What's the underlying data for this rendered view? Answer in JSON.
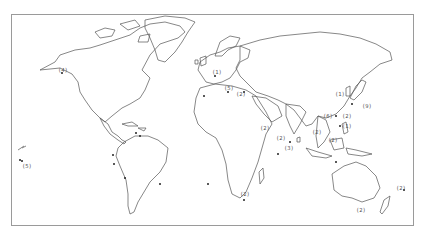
{
  "map": {
    "type": "world outline map",
    "style": "monochrome line drawing",
    "colors": {
      "land_outline": "#555555",
      "frame": "#9a9a9a",
      "marker": "#222222",
      "background": "#ffffff"
    },
    "labels": [
      {
        "id": "alaska",
        "text": "(4)"
      },
      {
        "id": "hawaii",
        "text": "(5)"
      },
      {
        "id": "europe-north",
        "text": "(1)"
      },
      {
        "id": "europe-south",
        "text": "(5)"
      },
      {
        "id": "east-med",
        "text": "(2)"
      },
      {
        "id": "arabia",
        "text": "(2)"
      },
      {
        "id": "india",
        "text": "(2)"
      },
      {
        "id": "sri-lanka",
        "text": "(3)"
      },
      {
        "id": "china-south",
        "text": "(6)"
      },
      {
        "id": "taiwan",
        "text": "(2)"
      },
      {
        "id": "philippines",
        "text": "(1)"
      },
      {
        "id": "korea",
        "text": "(1)"
      },
      {
        "id": "japan",
        "text": "(9)"
      },
      {
        "id": "indochina",
        "text": "(2)"
      },
      {
        "id": "borneo",
        "text": "(2)"
      },
      {
        "id": "south-africa",
        "text": "(2)"
      },
      {
        "id": "australia-south",
        "text": "(2)"
      },
      {
        "id": "pacific-east",
        "text": "(2)"
      }
    ]
  }
}
